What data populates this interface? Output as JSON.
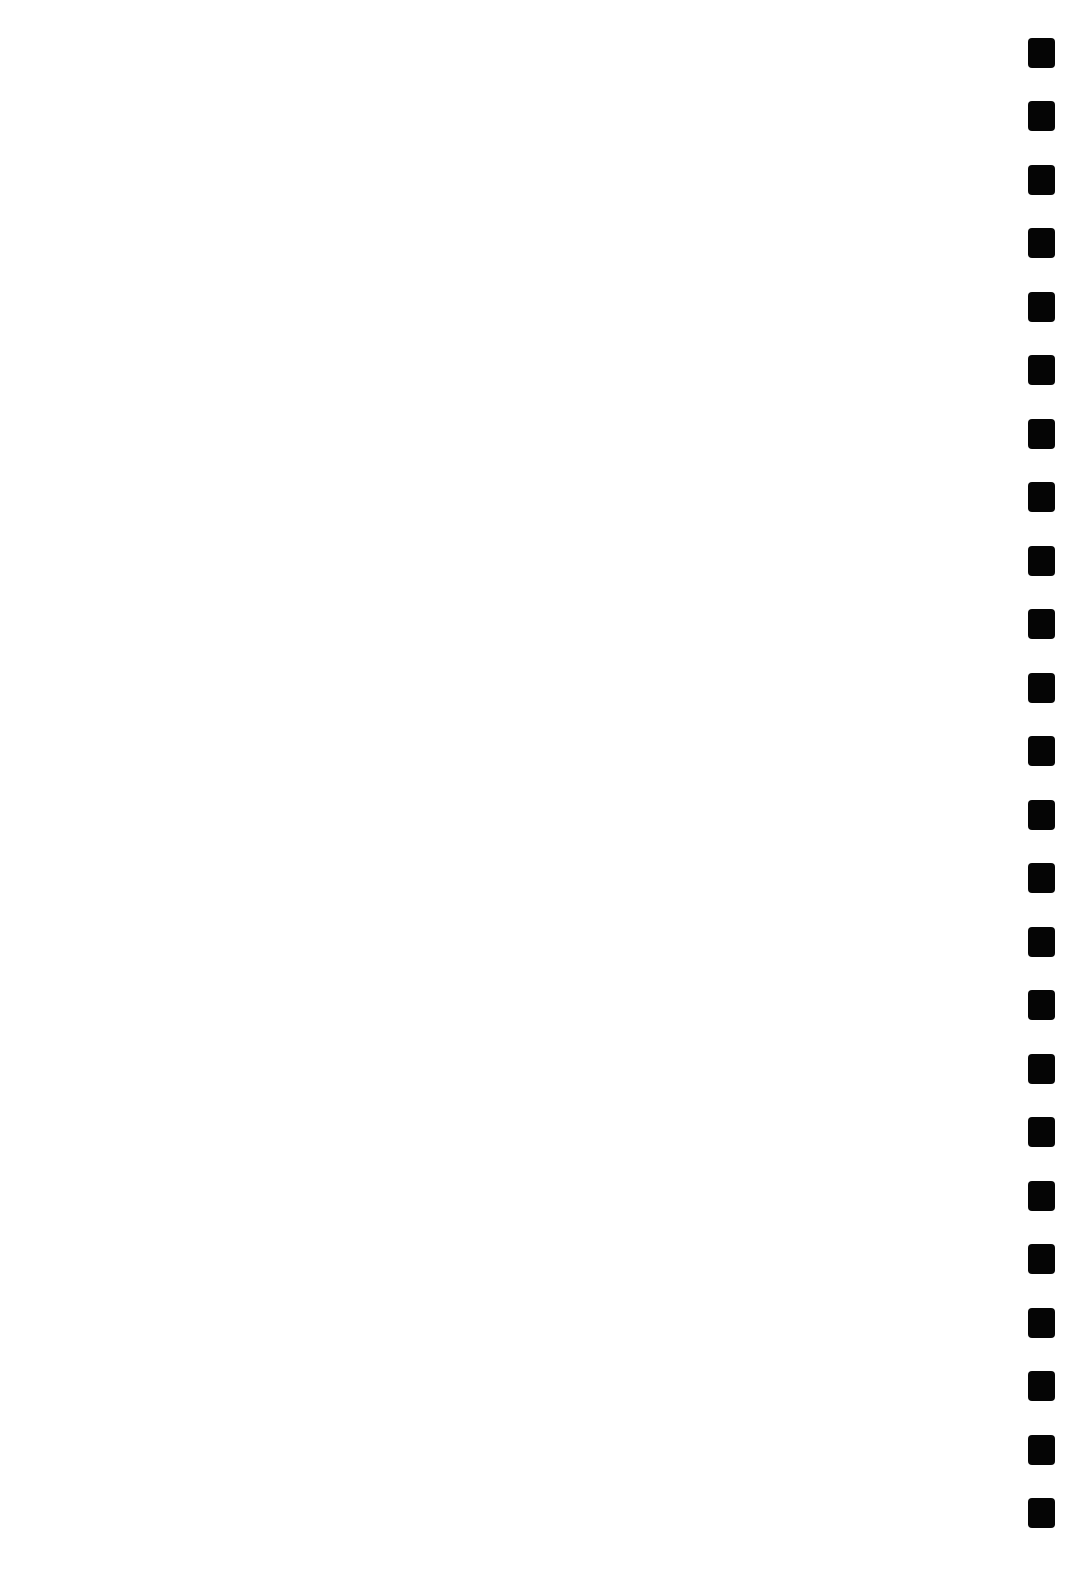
{
  "page": {
    "background": "#ffffff",
    "width": 1083,
    "height": 1585
  },
  "binding_holes": {
    "color": "#050505",
    "x": 1028,
    "width": 27,
    "height": 30,
    "count": 24,
    "tops": [
      38,
      101,
      165,
      228,
      292,
      355,
      419,
      482,
      546,
      609,
      673,
      736,
      800,
      863,
      927,
      990,
      1054,
      1117,
      1181,
      1244,
      1308,
      1371,
      1435,
      1498
    ]
  }
}
